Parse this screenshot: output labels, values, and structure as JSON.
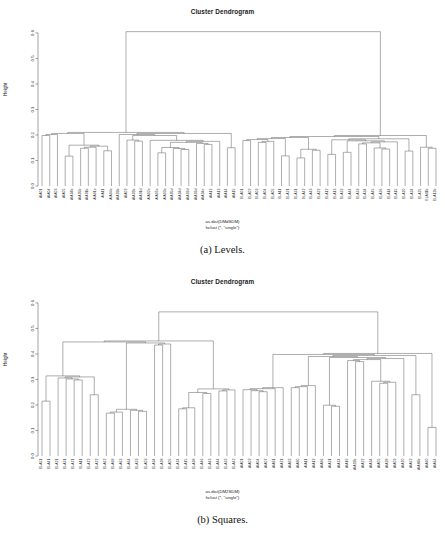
{
  "figure": {
    "panels": [
      {
        "id": "levels",
        "title": "Cluster Dendrogram",
        "ylabel": "Height",
        "subtitle_line1": "as.dist(DMdSDM)",
        "subtitle_line2": "hclust (*, \"single\")",
        "caption": "(a) Levels."
      },
      {
        "id": "squares",
        "title": "Cluster Dendrogram",
        "ylabel": "Height",
        "subtitle_line1": "as.dist(DM2SDM)",
        "subtitle_line2": "hclust (*, \"single\")",
        "caption": "(b) Squares."
      }
    ]
  },
  "chart_data": [
    {
      "type": "line",
      "subtype": "dendrogram",
      "title": "Cluster Dendrogram",
      "xlabel": "as.dist(DMdSDM)",
      "ylabel": "Height",
      "ylim": [
        0.0,
        0.6
      ],
      "yticks": [
        "0.0",
        "0.1",
        "0.2",
        "0.3",
        "0.4",
        "0.5",
        "0.6"
      ],
      "grid": false,
      "legend": null,
      "linkage": "single",
      "root_height": 0.605,
      "leaves": [
        "AIA01",
        "AIA04",
        "AIA03",
        "AIA05",
        "AIA04b",
        "AIA05b",
        "AIA01b",
        "AIA01c",
        "AIA11",
        "AIA04c",
        "AIA03b",
        "AIA02",
        "AIA02b",
        "AIA01d",
        "AIA02c",
        "AIA05c",
        "AIA03c",
        "AIA05d",
        "AIA04d",
        "AIA02d",
        "AIA03d",
        "AIA04e",
        "AIA12",
        "AIA13",
        "AIA14",
        "AIA15",
        "ELA01",
        "ELA02",
        "ELA03",
        "ELA04",
        "ELA05",
        "ELA11",
        "ELA21",
        "ELA31",
        "ELA42",
        "ELA43",
        "ELA22",
        "ELA12",
        "ELA13",
        "ELA32",
        "ELA44",
        "ELA33",
        "ELA34",
        "ELA45",
        "ELA26",
        "ELA14",
        "ELA15",
        "ELA20",
        "ELA24",
        "ELA25",
        "ELA11b",
        "ELA12b"
      ],
      "merge_heights": [
        0.605,
        0.178,
        0.131,
        0.112,
        0.176,
        0.171,
        0.163,
        0.145,
        0.143,
        0.138,
        0.135,
        0.132,
        0.128,
        0.124,
        0.12,
        0.118,
        0.117,
        0.115,
        0.112,
        0.11,
        0.108,
        0.133,
        0.13,
        0.103,
        0.198,
        0.168,
        0.158,
        0.126,
        0.165,
        0.148,
        0.15,
        0.14,
        0.137,
        0.134,
        0.13,
        0.122,
        0.118,
        0.114,
        0.11,
        0.106,
        0.103,
        0.101,
        0.148
      ],
      "clusters": [
        {
          "name": "AIA group",
          "prefix": "AIA",
          "n_leaves": 26,
          "max_height": 0.178
        },
        {
          "name": "EL group",
          "prefix": "EL",
          "n_leaves": 26,
          "max_height": 0.198
        }
      ]
    },
    {
      "type": "line",
      "subtype": "dendrogram",
      "title": "Cluster Dendrogram",
      "xlabel": "as.dist(DM2SDM)",
      "ylabel": "Height",
      "ylim": [
        0.0,
        0.6
      ],
      "yticks": [
        "0.0",
        "0.1",
        "0.2",
        "0.3",
        "0.4",
        "0.5",
        "0.6"
      ],
      "grid": false,
      "legend": null,
      "linkage": "single",
      "root_height": 0.565,
      "leaves": [
        "ELA51",
        "ELA41",
        "ELA21",
        "ELA31",
        "ELA71",
        "ELA11",
        "ELA72",
        "ELA22",
        "ELA62",
        "ELA68",
        "ELA63",
        "ELA64",
        "ELA23",
        "ELA03",
        "ELA34",
        "ELA28",
        "ELA05",
        "ELA74",
        "ELA15",
        "ELA38",
        "ELA46",
        "ELA43",
        "ELA44",
        "ELA32",
        "ELA42",
        "AIA01",
        "AIA02",
        "AIA04",
        "AIA07",
        "AIA81",
        "AIA71",
        "AIA82",
        "AIA80",
        "AIA11",
        "AIA12",
        "AIA86",
        "AIA31",
        "AIA74",
        "AIA16",
        "AIA02b",
        "AIA22",
        "AIA34",
        "AIA05",
        "AIA28",
        "AIA03",
        "AIA70",
        "AIA62",
        "AIA86b",
        "AIA60",
        "AIA64"
      ],
      "merge_heights": [
        0.565,
        0.285,
        0.268,
        0.215,
        0.255,
        0.252,
        0.24,
        0.195,
        0.15,
        0.188,
        0.185,
        0.18,
        0.175,
        0.17,
        0.163,
        0.118,
        0.128,
        0.125,
        0.108,
        0.098,
        0.095,
        0.102,
        0.118,
        0.14,
        0.158,
        0.155,
        0.435,
        0.37,
        0.298,
        0.272,
        0.245,
        0.24,
        0.168,
        0.132,
        0.215,
        0.205,
        0.2,
        0.195,
        0.138,
        0.12,
        0.155,
        0.15,
        0.146,
        0.13,
        0.125,
        0.118,
        0.112,
        0.105
      ],
      "clusters": [
        {
          "name": "EL group",
          "prefix": "EL",
          "n_leaves": 25,
          "max_height": 0.285
        },
        {
          "name": "AIA group",
          "prefix": "AIA",
          "n_leaves": 25,
          "max_height": 0.435
        }
      ]
    }
  ]
}
